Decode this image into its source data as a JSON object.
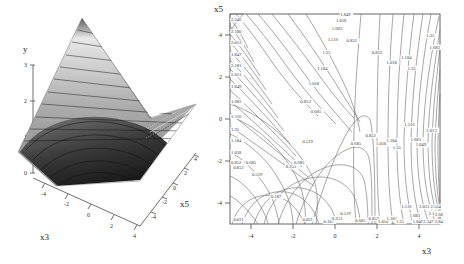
{
  "figure": {
    "panels": [
      {
        "id": "surface-plot",
        "type": "surface3d",
        "axes": {
          "vertical": {
            "label": "y",
            "ticks": [
              "3",
              "2",
              "1",
              "0"
            ],
            "tick_values": [
              3,
              2,
              1,
              0
            ],
            "range": [
              0,
              3.4
            ]
          },
          "depth": {
            "label": "x5",
            "ticks": [
              "-4",
              "-2",
              "0",
              "2",
              "4"
            ],
            "tick_values": [
              -4,
              -2,
              0,
              2,
              4
            ],
            "range": [
              -5,
              5
            ]
          },
          "horizontal": {
            "label": "x3",
            "ticks": [
              "-4",
              "-2",
              "0",
              "2",
              "4"
            ],
            "tick_values": [
              -4,
              -2,
              0,
              2,
              4
            ],
            "range": [
              -5,
              5
            ]
          }
        },
        "shading": {
          "description": "banded grayscale contour bands on saddle surface",
          "low_color": "#1c1c1c",
          "mid_color": "#8a8a8a",
          "high_color": "#f0f0f0",
          "band_line_color": "#111111"
        }
      },
      {
        "id": "contour-plot",
        "type": "contour",
        "axes": {
          "x": {
            "label": "x3",
            "ticks": [
              "-4",
              "-2",
              "0",
              "2",
              "4"
            ],
            "tick_values": [
              -4,
              -2,
              0,
              2,
              4
            ],
            "range": [
              -5,
              5
            ]
          },
          "y": {
            "label": "x5",
            "ticks": [
              "4",
              "2",
              "0",
              "-2",
              "-4"
            ],
            "tick_values": [
              4,
              2,
              0,
              -2,
              -4
            ],
            "range": [
              -5,
              5
            ]
          }
        },
        "frame": true,
        "line_color": "#6b6b6b"
      }
    ]
  },
  "chart_data": [
    {
      "type": "contour",
      "title": "",
      "xlabel": "x3",
      "ylabel": "y",
      "zlabel": "y",
      "panel": "surface3d-left",
      "xlim": [
        -5,
        5
      ],
      "ylim": [
        -5,
        5
      ],
      "zlim": [
        0,
        3.4
      ],
      "x_ticks": [
        -4,
        -2,
        0,
        2,
        4
      ],
      "y_ticks": [
        -4,
        -2,
        0,
        2,
        4
      ],
      "z_ticks": [
        0,
        1,
        2,
        3
      ],
      "z_axis_label": "y",
      "depth_axis_label": "x5",
      "grid": false,
      "legend": "none",
      "notes": "3D saddle/valley surface of y over (x3, x5); banded grayscale level sets; peak at far corner reaches above 3, valley floor near 0"
    },
    {
      "type": "contour",
      "title": "",
      "xlabel": "x3",
      "ylabel": "x5",
      "panel": "contour-right",
      "xlim": [
        -5,
        5
      ],
      "ylim": [
        -5,
        5
      ],
      "x_ticks": [
        -4,
        -2,
        0,
        2,
        4
      ],
      "y_ticks": [
        -4,
        -2,
        0,
        2,
        4
      ],
      "grid": false,
      "legend": "none",
      "levels": [
        0.021,
        0.187,
        0.353,
        0.519,
        0.685,
        0.852,
        1.018,
        1.184,
        1.35,
        1.516,
        1.683,
        1.849,
        2.013,
        2.181,
        2.347,
        2.534,
        2.68,
        2.84
      ],
      "level_step": 0.166,
      "inline_labels": [
        {
          "text": "0.021",
          "x": -4.85,
          "y": -4.85
        },
        {
          "text": "0.021",
          "x": -1.55,
          "y": -4.85
        },
        {
          "text": "0.187",
          "x": -3.05,
          "y": -3.75
        },
        {
          "text": "0.187",
          "x": -0.55,
          "y": -4.95
        },
        {
          "text": "0.353",
          "x": -2.35,
          "y": -2.35
        },
        {
          "text": "0.353",
          "x": -0.15,
          "y": -4.8
        },
        {
          "text": "0.519",
          "x": -1.55,
          "y": -1.15
        },
        {
          "text": "0.519",
          "x": 0.25,
          "y": -4.55
        },
        {
          "text": "0.685",
          "x": -1.95,
          "y": -2.15
        },
        {
          "text": "0.685",
          "x": -1.15,
          "y": 0.3
        },
        {
          "text": "0.685",
          "x": 0.75,
          "y": -1.25
        },
        {
          "text": "0.685",
          "x": 0.95,
          "y": -4.9
        },
        {
          "text": "0.519",
          "x": -3.95,
          "y": -2.7
        },
        {
          "text": "0.685",
          "x": -4.25,
          "y": -2.15
        },
        {
          "text": "0.852",
          "x": -4.85,
          "y": -2.4
        },
        {
          "text": "0.852",
          "x": -1.65,
          "y": 0.75
        },
        {
          "text": "0.852",
          "x": 0.55,
          "y": 3.65
        },
        {
          "text": "0.852",
          "x": 1.75,
          "y": 3.1
        },
        {
          "text": "0.852",
          "x": 1.45,
          "y": -0.85
        },
        {
          "text": "0.852",
          "x": 1.6,
          "y": -4.8
        },
        {
          "text": "1.018",
          "x": -1.25,
          "y": 1.6
        },
        {
          "text": "1.018",
          "x": 0.05,
          "y": 4.6
        },
        {
          "text": "1.018",
          "x": 2.45,
          "y": 2.6
        },
        {
          "text": "1.018",
          "x": 1.95,
          "y": -1.25
        },
        {
          "text": "1.018",
          "x": 2.05,
          "y": -4.95
        },
        {
          "text": "1.184",
          "x": -0.85,
          "y": 2.35
        },
        {
          "text": "1.184",
          "x": 3.15,
          "y": 2.85
        },
        {
          "text": "1.184",
          "x": 2.45,
          "y": -1.1
        },
        {
          "text": "1.184",
          "x": 2.45,
          "y": -4.8
        },
        {
          "text": "1.35",
          "x": -0.6,
          "y": 3.1
        },
        {
          "text": "1.35",
          "x": 4.35,
          "y": 3.9
        },
        {
          "text": "1.35",
          "x": 3.45,
          "y": 2.35
        },
        {
          "text": "1.35",
          "x": 2.75,
          "y": -1.45
        },
        {
          "text": "1.35",
          "x": 2.9,
          "y": -4.95
        },
        {
          "text": "1.516",
          "x": -0.35,
          "y": 3.7
        },
        {
          "text": "1.516",
          "x": 3.3,
          "y": -0.35
        },
        {
          "text": "1.516",
          "x": 3.15,
          "y": -4.25
        },
        {
          "text": "1.683",
          "x": -0.15,
          "y": 4.25
        },
        {
          "text": "1.683",
          "x": 4.5,
          "y": 3.35
        },
        {
          "text": "1.683",
          "x": 3.6,
          "y": -1.05
        },
        {
          "text": "1.683",
          "x": 3.55,
          "y": -4.65
        },
        {
          "text": "1.849",
          "x": 0.25,
          "y": 4.9
        },
        {
          "text": "1.849",
          "x": 3.85,
          "y": -1.3
        },
        {
          "text": "1.849",
          "x": 3.7,
          "y": -4.95
        },
        {
          "text": "2.013",
          "x": 4.35,
          "y": -0.6
        },
        {
          "text": "2.013",
          "x": 4.0,
          "y": -4.25
        },
        {
          "text": "2.181",
          "x": 4.45,
          "y": -4.55
        },
        {
          "text": "2.347",
          "x": 4.2,
          "y": -4.95
        },
        {
          "text": "2.534",
          "x": 4.55,
          "y": -4.25
        },
        {
          "text": "2.68",
          "x": 4.75,
          "y": -4.6
        },
        {
          "text": "2.84",
          "x": 4.75,
          "y": -4.95
        },
        {
          "text": "2.346",
          "x": -4.95,
          "y": 4.65
        },
        {
          "text": "2.180",
          "x": -4.95,
          "y": 4.1
        },
        {
          "text": "2.013",
          "x": -4.95,
          "y": 3.55
        },
        {
          "text": "1.847",
          "x": -4.95,
          "y": 3.0
        },
        {
          "text": "2.181",
          "x": -4.95,
          "y": 2.5
        },
        {
          "text": "2.011",
          "x": -4.95,
          "y": 2.05
        },
        {
          "text": "1.849",
          "x": -4.95,
          "y": 1.5
        },
        {
          "text": "1.683",
          "x": -4.95,
          "y": 0.75
        },
        {
          "text": "1.516",
          "x": -4.95,
          "y": 0.05
        },
        {
          "text": "1.35",
          "x": -4.95,
          "y": -0.55
        },
        {
          "text": "1.184",
          "x": -4.95,
          "y": -1.1
        },
        {
          "text": "1.018",
          "x": -4.95,
          "y": -1.65
        },
        {
          "text": "0.852",
          "x": -4.95,
          "y": -2.15
        }
      ],
      "notes": "Saddle-shaped level sets. Values increase toward the upper-left and lower-right corners; a low valley runs from lower-left toward the center-bottom. Level spacing is uniform at about 0.166."
    }
  ]
}
